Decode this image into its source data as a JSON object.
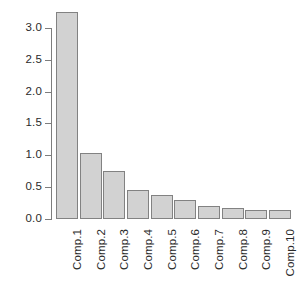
{
  "chart_data": {
    "type": "bar",
    "title": "",
    "subtitle": "",
    "xlabel": "",
    "ylabel": "",
    "categories": [
      "Comp.1",
      "Comp.2",
      "Comp.3",
      "Comp.4",
      "Comp.5",
      "Comp.6",
      "Comp.7",
      "Comp.8",
      "Comp.9",
      "Comp.10"
    ],
    "values": [
      3.25,
      1.04,
      0.75,
      0.45,
      0.38,
      0.3,
      0.2,
      0.17,
      0.14,
      0.14
    ],
    "ylim": [
      0,
      3.25
    ],
    "yticks": [
      0.0,
      0.5,
      1.0,
      1.5,
      2.0,
      2.5,
      3.0
    ],
    "ytick_labels": [
      "0.0",
      "0.5",
      "1.0",
      "1.5",
      "2.0",
      "2.5",
      "3.0"
    ],
    "grid": false,
    "legend": null,
    "bar_fill_color": "#d2d2d2",
    "bar_border_color": "#828282",
    "axis_color": "#7d7d7d",
    "text_color": "#2a2a2a",
    "background_color": "#ffffff",
    "xtick_label_rotation": 90
  }
}
